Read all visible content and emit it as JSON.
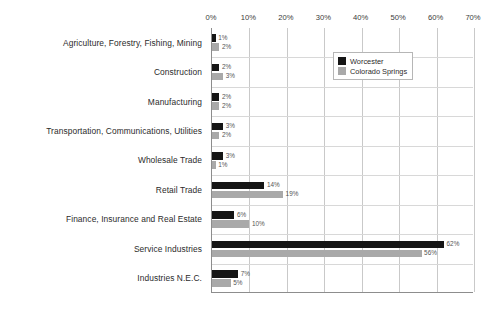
{
  "chart_data": {
    "type": "bar",
    "orientation": "horizontal",
    "title": "",
    "subtitle": "",
    "xlabel": "",
    "ylabel": "",
    "xlim": [
      0,
      70
    ],
    "xtick_labels": [
      "0%",
      "10%",
      "20%",
      "30%",
      "40%",
      "50%",
      "60%",
      "70%"
    ],
    "xtick_values": [
      0,
      10,
      20,
      30,
      40,
      50,
      60,
      70
    ],
    "grid": true,
    "grid_axis": "x",
    "axis_label_position": "top",
    "legend_position": "upper-center-right",
    "value_labels": true,
    "value_label_suffix": "%",
    "categories": [
      "Agriculture, Forestry, Fishing, Mining",
      "Construction",
      "Manufacturing",
      "Transportation, Communications, Utilities",
      "Wholesale Trade",
      "Retail Trade",
      "Finance, Insurance and Real Estate",
      "Service Industries",
      "Industries N.E.C."
    ],
    "series": [
      {
        "name": "Worcester",
        "color": "#151515",
        "values": [
          1,
          2,
          2,
          3,
          3,
          14,
          6,
          62,
          7
        ],
        "labels": [
          "1%",
          "2%",
          "2%",
          "3%",
          "3%",
          "14%",
          "6%",
          "62%",
          "7%"
        ]
      },
      {
        "name": "Colorado Springs",
        "color": "#a9a9a9",
        "values": [
          2,
          3,
          2,
          2,
          1,
          19,
          10,
          56,
          5
        ],
        "labels": [
          "2%",
          "3%",
          "2%",
          "2%",
          "1%",
          "19%",
          "10%",
          "56%",
          "5%"
        ]
      }
    ]
  },
  "legend": {
    "entries": [
      {
        "label": "Worcester",
        "color": "#151515"
      },
      {
        "label": "Colorado Springs",
        "color": "#a9a9a9"
      }
    ]
  },
  "colors": {
    "worcester": "#151515",
    "colorado_springs": "#a9a9a9",
    "gridline": "#c9c9c9",
    "axis": "#8d8d8d",
    "text": "#2b2b2b",
    "value_text": "#555555",
    "background": "#ffffff"
  }
}
